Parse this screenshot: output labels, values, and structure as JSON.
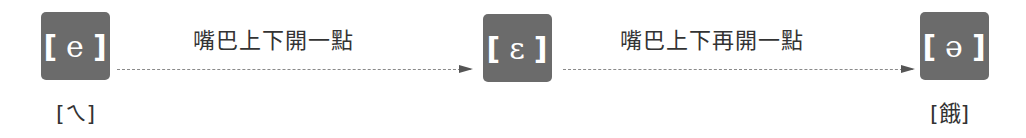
{
  "diagram": {
    "nodes": [
      {
        "id": "e",
        "symbol": "e",
        "left_bracket": "[",
        "right_bracket": "]",
        "sub_label": "[ㄟ]"
      },
      {
        "id": "epsilon",
        "symbol": "ɛ",
        "left_bracket": "[",
        "right_bracket": "]",
        "sub_label": ""
      },
      {
        "id": "schwa",
        "symbol": "ə",
        "left_bracket": "[",
        "right_bracket": "]",
        "sub_label": "[餓]"
      }
    ],
    "edges": [
      {
        "from": "e",
        "to": "epsilon",
        "label": "嘴巴上下開一點"
      },
      {
        "from": "epsilon",
        "to": "schwa",
        "label": "嘴巴上下再開一點"
      }
    ],
    "colors": {
      "box": "#6b6b6b",
      "box_text": "#ffffff",
      "arrow": "#555555",
      "text": "#333333"
    }
  }
}
